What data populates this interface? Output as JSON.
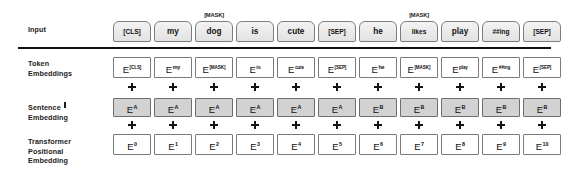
{
  "diagram": {
    "colors": {
      "input_box_fill": "#ebebeb",
      "segment_box_fill": "#d2d2d2",
      "embedding_box_fill": "#ffffff",
      "border": "#7a7a7a",
      "text": "#111111"
    },
    "rows": [
      {
        "id": "input",
        "label": "Input",
        "has_dagger": false
      },
      {
        "id": "token",
        "label": "Token\nEmbeddings",
        "has_dagger": false
      },
      {
        "id": "segment",
        "label": "Sentence\nEmbedding",
        "has_dagger": true
      },
      {
        "id": "position",
        "label": "Transformer\nPositional\nEmbedding",
        "has_dagger": false
      }
    ],
    "row_labels": {
      "input": "Input",
      "token_line1": "Token",
      "token_line2": "Embeddings",
      "sentence_line1": "Sentence",
      "sentence_line2": "Embedding",
      "transformer_line1": "Transformer",
      "transformer_line2": "Positional",
      "transformer_line3": "Embedding"
    },
    "plus_symbol": "+",
    "columns": [
      {
        "index": 0,
        "input_token": "[CLS]",
        "mask_tag": "",
        "token_embedding_main": "E",
        "token_embedding_sub": "[CLS]",
        "segment_embedding_main": "E",
        "segment_embedding_sub": "A",
        "positional_embedding_main": "E",
        "positional_embedding_sub": "0"
      },
      {
        "index": 1,
        "input_token": "my",
        "mask_tag": "",
        "token_embedding_main": "E",
        "token_embedding_sub": "my",
        "segment_embedding_main": "E",
        "segment_embedding_sub": "A",
        "positional_embedding_main": "E",
        "positional_embedding_sub": "1"
      },
      {
        "index": 2,
        "input_token": "dog",
        "mask_tag": "[MASK]",
        "token_embedding_main": "E",
        "token_embedding_sub": "[MASK]",
        "segment_embedding_main": "E",
        "segment_embedding_sub": "A",
        "positional_embedding_main": "E",
        "positional_embedding_sub": "2"
      },
      {
        "index": 3,
        "input_token": "is",
        "mask_tag": "",
        "token_embedding_main": "E",
        "token_embedding_sub": "is",
        "segment_embedding_main": "E",
        "segment_embedding_sub": "A",
        "positional_embedding_main": "E",
        "positional_embedding_sub": "3"
      },
      {
        "index": 4,
        "input_token": "cute",
        "mask_tag": "",
        "token_embedding_main": "E",
        "token_embedding_sub": "cute",
        "segment_embedding_main": "E",
        "segment_embedding_sub": "A",
        "positional_embedding_main": "E",
        "positional_embedding_sub": "4"
      },
      {
        "index": 5,
        "input_token": "[SEP]",
        "mask_tag": "",
        "token_embedding_main": "E",
        "token_embedding_sub": "[SEP]",
        "segment_embedding_main": "E",
        "segment_embedding_sub": "A",
        "positional_embedding_main": "E",
        "positional_embedding_sub": "5"
      },
      {
        "index": 6,
        "input_token": "he",
        "mask_tag": "",
        "token_embedding_main": "E",
        "token_embedding_sub": "he",
        "segment_embedding_main": "E",
        "segment_embedding_sub": "B",
        "positional_embedding_main": "E",
        "positional_embedding_sub": "6"
      },
      {
        "index": 7,
        "input_token": "likes",
        "mask_tag": "[MASK]",
        "token_embedding_main": "E",
        "token_embedding_sub": "[MASK]",
        "segment_embedding_main": "E",
        "segment_embedding_sub": "B",
        "positional_embedding_main": "E",
        "positional_embedding_sub": "7"
      },
      {
        "index": 8,
        "input_token": "play",
        "mask_tag": "",
        "token_embedding_main": "E",
        "token_embedding_sub": "play",
        "segment_embedding_main": "E",
        "segment_embedding_sub": "B",
        "positional_embedding_main": "E",
        "positional_embedding_sub": "8"
      },
      {
        "index": 9,
        "input_token": "##ing",
        "mask_tag": "",
        "token_embedding_main": "E",
        "token_embedding_sub": "##ing",
        "segment_embedding_main": "E",
        "segment_embedding_sub": "B",
        "positional_embedding_main": "E",
        "positional_embedding_sub": "9"
      },
      {
        "index": 10,
        "input_token": "[SEP]",
        "mask_tag": "",
        "token_embedding_main": "E",
        "token_embedding_sub": "[SEP]",
        "segment_embedding_main": "E",
        "segment_embedding_sub": "B",
        "positional_embedding_main": "E",
        "positional_embedding_sub": "10"
      }
    ]
  }
}
